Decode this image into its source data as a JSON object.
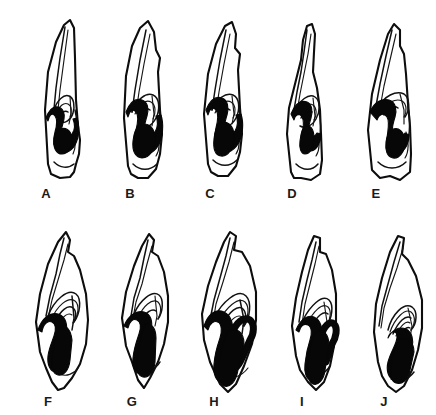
{
  "figure": {
    "kind": "line-drawing-plate",
    "rows": 2,
    "columns": 5,
    "total_specimens": 10,
    "background_color": "#ffffff",
    "ink_color": "#0d0d0d",
    "enamel_fill_color": "#070707"
  },
  "specimens": [
    {
      "id": "a",
      "label": "A",
      "row": 1,
      "column": 1,
      "x": 18,
      "y": 14,
      "width": 66,
      "height": 168,
      "label_x": 36,
      "label_y": 186,
      "outline": "M 30 150 L 27 96 L 30 58 L 38 28 L 46 11 L 52 6 L 56 14 L 57 44 L 58 86 L 60 112 L 62 126 L 61 140 L 58 150 L 56 158 L 52 163 L 42 164 L 33 160 Z",
      "folds": [
        "M 47 13 L 42 44 L 38 74 L 36 95",
        "M 50 16 L 46 46 L 42 76 L 40 96",
        "M 36 96 C 39 86 46 80 51 82 C 56 84 57 92 55 99 C 53 106 47 110 42 108",
        "M 38 100 C 41 92 46 88 50 90 C 54 92 54 98 52 103",
        "M 41 104 C 43 98 47 96 50 98",
        "M 52 82 L 53 100 L 51 110",
        "M 57 96 C 59 104 59 116 57 124",
        "M 55 118 C 58 124 58 134 55 140",
        "M 36 148 C 42 154 50 155 56 150"
      ],
      "enamel_band": "M 28 104 C 31 96 35 92 40 93 C 45 94 47 99 46 105 C 45 111 42 116 44 121 C 46 126 51 124 54 120 C 57 116 57 110 55 105 L 59 104 C 62 112 61 124 57 131 C 53 138 45 141 40 137 C 35 133 35 125 37 118 C 39 111 40 106 37 102 C 34 98 31 101 30 107 Z",
      "enamel_blob": "M 41 116 C 47 112 53 116 54 124 C 55 132 50 140 44 140 C 38 140 35 133 36 126 C 37 120 38 118 41 116 Z"
    },
    {
      "id": "b",
      "label": "B",
      "row": 1,
      "column": 2,
      "x": 100,
      "y": 14,
      "width": 70,
      "height": 168,
      "label_x": 120,
      "label_y": 186,
      "outline": "M 28 152 L 24 104 L 26 62 L 32 32 L 40 14 L 48 7 L 54 18 L 56 36 L 60 44 L 58 58 L 60 96 L 62 120 L 60 140 L 56 155 L 48 164 L 38 164 L 31 160 Z",
      "folds": [
        "M 46 16 L 40 46 L 35 76 L 32 98",
        "M 50 20 L 44 50 L 39 78 L 36 99",
        "M 32 98 C 36 86 46 78 53 81 C 60 84 60 96 56 104 C 52 112 44 116 38 113",
        "M 35 100 C 39 90 46 85 51 88 C 56 91 56 99 53 105",
        "M 38 103 C 41 96 46 93 50 96",
        "M 52 82 L 54 100 L 52 112",
        "M 59 98 C 62 106 62 118 59 126",
        "M 57 120 C 60 126 60 136 56 142",
        "M 33 150 C 40 157 50 157 57 150"
      ],
      "enamel_band": "M 26 98 C 30 88 36 84 42 86 C 48 88 49 95 47 102 C 45 109 43 114 45 119 C 47 124 52 123 55 118 C 58 113 58 107 56 102 L 61 101 C 64 110 63 124 58 132 C 53 140 44 143 39 138 C 34 133 34 124 36 116 C 38 108 39 102 36 98 C 33 94 29 97 28 103 Z",
      "enamel_blob": "M 39 112 C 46 107 54 112 55 122 C 56 134 50 144 42 144 C 35 144 32 136 33 127 C 34 119 35 116 39 112 Z"
    },
    {
      "id": "c",
      "label": "C",
      "row": 1,
      "column": 3,
      "x": 182,
      "y": 14,
      "width": 66,
      "height": 168,
      "label_x": 200,
      "label_y": 186,
      "outline": "M 26 150 L 22 100 L 26 60 L 34 30 L 43 12 L 50 8 L 54 20 L 53 34 L 58 40 L 56 56 L 58 94 L 60 120 L 58 138 L 54 152 L 46 162 L 36 162 L 29 158 Z",
      "folds": [
        "M 44 16 L 38 46 L 33 76 L 30 96",
        "M 48 20 L 42 50 L 37 78 L 34 98",
        "M 30 96 C 34 85 44 78 51 81 C 58 84 58 96 54 104 C 50 112 42 115 36 112",
        "M 33 99 C 37 90 44 85 49 88 C 54 91 54 99 51 104",
        "M 36 102 C 39 96 44 93 48 96",
        "M 50 82 L 52 100 L 50 110",
        "M 57 96 C 60 104 60 116 57 124",
        "M 55 118 C 58 124 58 134 54 140",
        "M 31 146 C 38 153 48 153 55 146"
      ],
      "enamel_band": "M 24 96 C 28 86 34 82 40 84 C 46 86 47 94 45 101 C 43 108 41 113 43 118 C 45 123 50 122 53 117 C 56 112 56 106 54 101 L 59 100 C 62 109 61 122 56 130 C 51 138 42 141 37 136 C 32 131 32 122 34 114 C 36 106 37 100 34 96 C 31 92 27 95 26 101 Z",
      "enamel_blob": "M 37 110 C 44 105 52 111 52 122 C 52 134 46 143 39 142 C 33 141 31 134 32 125 C 33 117 34 113 37 110 Z"
    },
    {
      "id": "d",
      "label": "D",
      "row": 1,
      "column": 4,
      "x": 265,
      "y": 14,
      "width": 62,
      "height": 170,
      "label_x": 282,
      "label_y": 186,
      "outline": "M 26 158 L 22 120 L 24 94 L 30 70 L 36 46 L 38 26 L 42 12 L 47 10 L 50 20 L 49 38 L 48 58 L 52 74 L 55 96 L 56 120 L 57 146 L 55 160 L 46 166 L 36 164 L 29 164 Z",
      "folds": [
        "M 42 16 L 39 38 L 36 58 L 32 78 L 29 96",
        "M 46 20 L 43 40 L 39 60 L 35 80 L 32 98",
        "M 30 98 C 34 86 44 79 50 83 C 56 87 55 98 51 105 C 47 112 40 115 35 112",
        "M 33 101 C 37 92 43 88 48 91 C 52 94 52 101 49 106",
        "M 36 104 C 39 98 43 96 47 98",
        "M 48 84 L 50 102 L 48 112",
        "M 54 98 C 56 106 56 118 54 126",
        "M 52 120 C 55 126 55 136 51 142",
        "M 31 150 C 38 157 47 157 53 150"
      ],
      "enamel_band": "M 26 100 C 30 90 36 86 42 88 C 47 90 48 97 46 104 C 44 111 42 116 44 120 C 46 124 50 123 52 119 L 56 120 C 56 128 52 136 46 137 C 40 138 36 132 37 124 C 38 116 40 108 37 103 C 34 98 30 101 29 106 Z",
      "enamel_blob": "M 40 112 C 45 110 49 115 49 124 C 49 133 45 140 40 140 C 36 140 34 134 35 127 C 36 119 37 114 40 112 Z"
    },
    {
      "id": "e",
      "label": "E",
      "row": 1,
      "column": 5,
      "x": 348,
      "y": 14,
      "width": 70,
      "height": 170,
      "label_x": 366,
      "label_y": 186,
      "outline": "M 24 156 L 20 116 L 24 80 L 32 46 L 40 20 L 46 10 L 52 16 L 52 32 L 56 40 L 58 60 L 60 90 L 62 112 L 63 140 L 62 158 L 52 166 L 42 162 L 32 164 Z",
      "folds": [
        "M 44 16 L 38 42 L 32 70 L 28 92",
        "M 48 20 L 42 46 L 36 72 L 32 94",
        "M 30 94 C 36 82 48 76 56 80 C 62 84 62 96 57 103",
        "M 33 98 C 39 88 48 84 54 87 C 59 90 59 98 56 103",
        "M 36 101 C 40 94 46 91 50 94",
        "M 52 80 L 56 96 L 56 110",
        "M 60 92 C 62 102 62 116 60 126",
        "M 58 118 C 61 126 61 138 57 144",
        "M 30 148 C 38 156 50 156 58 148"
      ],
      "enamel_band": "M 22 98 C 26 88 34 84 41 86 C 48 88 49 96 47 103 C 45 110 43 116 46 121 C 49 126 54 124 57 119 L 61 121 C 61 131 55 140 48 140 C 41 140 38 133 39 124 C 40 115 42 108 39 103 C 36 98 31 100 29 106 Z",
      "enamel_blob": "M 44 116 C 50 112 57 118 57 128 C 57 138 51 145 45 144 C 39 143 37 136 38 128 C 39 121 41 118 44 116 Z"
    },
    {
      "id": "f",
      "label": "F",
      "row": 2,
      "column": 1,
      "x": 16,
      "y": 222,
      "width": 78,
      "height": 170,
      "label_x": 38,
      "label_y": 394,
      "outline": "M 24 130 L 20 100 L 24 72 L 32 42 L 42 20 L 50 10 L 54 18 L 52 30 L 58 34 L 64 48 L 70 72 L 72 98 L 70 122 L 64 142 L 56 156 L 48 166 L 42 168 L 36 160 L 30 146 Z",
      "folds": [
        "M 48 16 L 44 32 L 40 52 L 34 74 L 30 94",
        "M 52 22 L 48 38 L 42 58 L 36 78 L 32 96",
        "M 32 94 C 38 78 52 66 60 72 C 66 77 64 92 58 100",
        "M 35 98 C 41 84 52 74 59 79 C 64 83 62 94 58 100",
        "M 39 100 C 44 89 52 82 57 86 C 61 89 60 97 57 101",
        "M 43 102 C 47 94 52 90 56 93",
        "M 56 74 L 58 96 L 56 108",
        "M 62 146 C 58 152 50 155 44 152"
      ],
      "enamel_band": "M 22 108 C 26 96 34 90 42 92 C 50 94 52 104 50 112 L 50 132 C 50 142 46 150 40 150 C 34 150 31 142 32 134 C 33 126 36 120 38 114 C 40 108 40 102 36 100 C 32 98 27 102 26 110 Z",
      "enamel_blob": "M 44 104 C 50 102 55 108 56 118 L 54 138 C 53 148 48 154 42 153 C 37 152 35 145 36 137 C 37 126 40 114 44 104 Z"
    },
    {
      "id": "g",
      "label": "G",
      "row": 2,
      "column": 2,
      "x": 102,
      "y": 222,
      "width": 72,
      "height": 170,
      "label_x": 122,
      "label_y": 394,
      "outline": "M 24 124 L 20 96 L 24 70 L 32 44 L 40 24 L 47 12 L 52 18 L 50 30 L 56 34 L 62 50 L 66 74 L 66 100 L 62 122 L 56 140 L 48 156 L 42 166 L 36 158 L 30 140 Z",
      "folds": [
        "M 46 18 L 42 36 L 38 56 L 32 76 L 29 94",
        "M 50 24 L 45 42 L 40 62 L 34 80 L 31 96",
        "M 32 92 C 38 78 50 68 57 73 C 62 77 61 90 56 97",
        "M 36 96 C 41 84 50 76 56 80 C 60 84 59 92 56 97",
        "M 40 98 C 44 90 50 86 54 89",
        "M 53 74 L 55 94 L 53 104",
        "M 58 140 C 54 147 46 150 40 147"
      ],
      "enamel_band": "M 22 104 C 26 94 34 88 42 90 C 49 92 51 100 49 108 L 49 134 C 49 144 45 152 39 152 C 33 152 30 144 31 136 C 32 126 35 118 37 112 C 39 106 39 100 35 98 C 31 96 27 100 26 106 Z",
      "enamel_blob": "M 43 102 C 49 100 54 106 54 116 L 53 140 C 52 150 47 156 41 155 C 36 154 34 147 35 139 C 36 128 39 112 43 102 Z"
    },
    {
      "id": "h",
      "label": "H",
      "row": 2,
      "column": 3,
      "x": 182,
      "y": 222,
      "width": 80,
      "height": 172,
      "label_x": 204,
      "label_y": 394,
      "outline": "M 22 118 L 20 92 L 26 64 L 34 40 L 42 20 L 48 10 L 54 14 L 52 28 L 60 30 L 68 44 L 74 70 L 74 98 L 70 122 L 62 144 L 54 162 L 46 170 L 38 162 L 28 140 Z",
      "folds": [
        "M 48 16 L 44 34 L 38 56 L 32 78 L 28 98",
        "M 52 20 L 47 40 L 41 60 L 34 82 L 31 100",
        "M 32 96 C 40 80 56 66 64 74 C 70 80 68 96 62 104",
        "M 36 100 C 44 86 56 74 63 80 C 68 85 66 96 62 104",
        "M 41 102 C 47 90 56 82 61 87 C 65 91 64 99 61 104",
        "M 46 104 C 50 96 56 92 60 95",
        "M 58 78 L 62 98 L 60 112",
        "M 66 146 C 60 154 50 158 42 154"
      ],
      "enamel_band": "M 22 104 C 26 92 34 86 42 90 C 50 94 52 104 50 114 L 50 140 C 50 152 46 160 40 160 C 34 160 31 152 32 142 C 33 130 36 122 38 116 C 40 110 40 102 36 100 C 32 98 27 102 26 108 Z",
      "enamel_band2": "M 50 112 C 54 100 62 94 68 98 C 73 102 72 112 68 118 L 60 136 C 56 146 50 150 46 146",
      "enamel_blob": "M 46 110 C 54 104 62 110 62 122 L 56 148 C 54 160 48 166 42 164 C 37 162 36 154 37 144 C 38 130 42 116 46 110 Z"
    },
    {
      "id": "i",
      "label": "I",
      "row": 2,
      "column": 4,
      "x": 272,
      "y": 222,
      "width": 70,
      "height": 172,
      "label_x": 292,
      "label_y": 394,
      "outline": "M 24 134 L 20 104 L 24 76 L 30 50 L 36 28 L 42 14 L 48 16 L 48 30 L 54 32 L 60 48 L 64 72 L 64 100 L 62 124 L 58 144 L 52 160 L 44 168 L 36 160 L 28 148 Z",
      "folds": [
        "M 44 20 L 40 38 L 35 58 L 30 80 L 27 100",
        "M 47 24 L 43 42 L 38 62 L 33 82 L 30 102",
        "M 31 98 C 38 84 50 72 57 78 C 62 83 60 96 55 103",
        "M 35 102 C 41 90 50 80 56 85 C 60 89 58 98 55 103",
        "M 40 104 C 45 94 52 88 56 92",
        "M 52 80 L 55 100 L 53 112",
        "M 58 144 C 53 152 44 156 37 152"
      ],
      "enamel_band": "M 24 108 C 28 98 35 92 42 95 C 49 98 51 107 49 116 L 49 142 C 49 152 45 158 40 158 C 34 158 32 150 33 142 C 34 132 36 124 38 118 C 40 112 40 105 36 103 C 32 101 28 104 27 110 Z",
      "enamel_band2": "M 49 114 C 52 104 58 98 62 102 C 66 106 64 116 60 122 L 54 140",
      "enamel_blob": "M 44 110 C 51 106 57 112 57 124 L 53 148 C 52 158 46 164 41 162 C 36 160 35 152 36 142 C 37 130 40 116 44 110 Z"
    },
    {
      "id": "j",
      "label": "J",
      "row": 2,
      "column": 5,
      "x": 352,
      "y": 222,
      "width": 74,
      "height": 172,
      "label_x": 374,
      "label_y": 394,
      "outline": "M 26 140 L 22 110 L 24 82 L 30 56 L 38 30 L 46 14 L 52 16 L 50 32 L 56 38 L 64 54 L 70 78 L 70 106 L 66 128 L 60 148 L 52 164 L 44 170 L 36 164 L 30 154 Z",
      "folds": [
        "M 48 20 L 42 40 L 36 62 L 30 84 L 27 104",
        "M 51 26 L 45 46 L 38 66 L 32 86 L 29 106",
        "M 36 108 C 40 92 52 80 60 85 C 66 89 65 102 59 108",
        "M 38 110 C 43 96 53 86 59 90 C 64 94 63 103 59 108",
        "M 41 112 C 46 100 54 92 59 96",
        "M 44 114 C 48 104 54 98 58 101",
        "M 47 116 C 50 108 55 104 58 106",
        "M 56 86 L 60 104 L 58 116",
        "M 62 150 C 56 158 46 162 39 157"
      ],
      "enamel_band": "M 36 116 C 40 108 47 104 54 107 C 60 110 62 118 60 126 L 56 144 C 54 154 48 160 42 158 C 36 156 34 148 36 140 C 38 132 42 126 44 120 C 46 114 45 110 42 110 C 39 110 37 112 36 116 Z",
      "enamel_blob": "M 48 118 C 55 114 62 120 62 130 L 58 148 C 56 158 50 163 44 161 C 39 159 38 152 39 144 C 40 133 44 122 48 118 Z"
    }
  ]
}
